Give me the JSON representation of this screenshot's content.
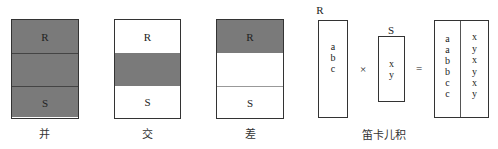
{
  "colors": {
    "shaded": "#7a7a7a",
    "border": "#333333",
    "background": "#ffffff"
  },
  "union": {
    "top_label": "R",
    "bottom_label": "S",
    "caption": "并"
  },
  "intersection": {
    "top_label": "R",
    "bottom_label": "S",
    "caption": "交"
  },
  "difference": {
    "top_label": "R",
    "bottom_label": "S",
    "caption": "差"
  },
  "cartesian": {
    "r_label": "R",
    "r_values": [
      "a",
      "b",
      "c"
    ],
    "times_symbol": "×",
    "s_label": "S",
    "s_values": [
      "x",
      "y"
    ],
    "equals_symbol": "=",
    "result_left": [
      "a",
      "a",
      "b",
      "b",
      "c",
      "c"
    ],
    "result_right": [
      "x",
      "y",
      "x",
      "y",
      "x",
      "y"
    ],
    "caption": "笛卡儿积"
  }
}
